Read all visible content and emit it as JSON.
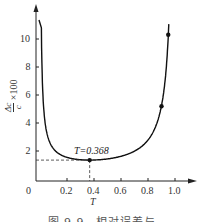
{
  "chart_data": {
    "type": "line",
    "title": "",
    "xlabel": "T",
    "ylabel": "Δc/c × 100",
    "ylabel_parts": {
      "num": "Δc",
      "den": "c",
      "suffix": "×100"
    },
    "xlim": [
      0,
      1.1
    ],
    "ylim": [
      0,
      11.5
    ],
    "grid": false,
    "x_ticks": [
      0.2,
      0.4,
      0.6,
      0.8,
      1.0
    ],
    "x_tick_labels": [
      "0.2",
      "0.4",
      "0.6",
      "0.8",
      "1.0"
    ],
    "y_ticks": [
      2,
      4,
      6,
      8,
      10
    ],
    "y_tick_labels": [
      "2",
      "4",
      "6",
      "8",
      "10"
    ],
    "origin_label": "0",
    "series": [
      {
        "name": "relative error curve",
        "formula": "y = -0.497 / (T * ln T)",
        "x": [
          0.02,
          0.03,
          0.05,
          0.08,
          0.1,
          0.15,
          0.2,
          0.25,
          0.3,
          0.368,
          0.4,
          0.5,
          0.6,
          0.7,
          0.8,
          0.85,
          0.9,
          0.93,
          0.95,
          0.956
        ],
        "values": [
          6.35,
          4.73,
          3.32,
          2.46,
          2.16,
          1.75,
          1.54,
          1.43,
          1.38,
          1.35,
          1.36,
          1.43,
          1.62,
          1.99,
          2.78,
          3.6,
          5.24,
          7.54,
          10.2,
          11.4
        ]
      }
    ],
    "marked_points": [
      {
        "x": 0.368,
        "y": 1.35
      },
      {
        "x": 0.9,
        "y": 5.2
      },
      {
        "x": 0.95,
        "y": 10.3
      }
    ],
    "annotations": [
      {
        "text": "T=0.368",
        "x": 0.368,
        "y": 1.35,
        "dashed_guides": true
      }
    ]
  },
  "caption": "图 9.9　相对误差与"
}
